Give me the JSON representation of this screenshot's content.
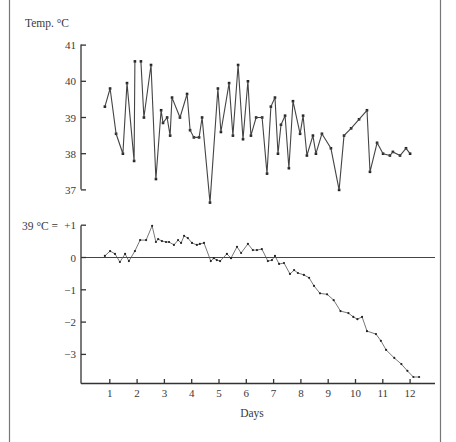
{
  "chart_data": [
    {
      "type": "line",
      "title": "",
      "ylabel": "Temp. °C",
      "xlabel": "",
      "ylim": [
        37,
        41
      ],
      "yticks": [
        37,
        38,
        39,
        40,
        41
      ],
      "grid": false,
      "markers": true,
      "series": [
        {
          "name": "Body temperature",
          "x": [
            0.82,
            1.01,
            1.23,
            1.48,
            1.63,
            1.89,
            1.92,
            2.14,
            2.25,
            2.51,
            2.69,
            2.88,
            2.95,
            3.1,
            3.21,
            3.28,
            3.57,
            3.83,
            3.94,
            4.08,
            4.27,
            4.38,
            4.67,
            4.96,
            5.07,
            5.37,
            5.51,
            5.7,
            5.88,
            6.06,
            6.17,
            6.36,
            6.58,
            6.76,
            6.9,
            7.05,
            7.16,
            7.27,
            7.42,
            7.56,
            7.71,
            7.97,
            8.08,
            8.22,
            8.44,
            8.55,
            8.77,
            9.1,
            9.4,
            9.58,
            9.84,
            10.13,
            10.42,
            10.53,
            10.79,
            11.01,
            11.26,
            11.37,
            11.63,
            11.85,
            12.0
          ],
          "values": [
            39.3,
            39.8,
            38.55,
            38.0,
            39.95,
            37.8,
            40.55,
            40.55,
            39.0,
            40.45,
            37.3,
            39.2,
            38.85,
            39.0,
            38.5,
            39.55,
            39.0,
            39.65,
            38.65,
            38.45,
            38.45,
            39.0,
            36.65,
            39.8,
            38.6,
            39.95,
            38.5,
            40.45,
            38.4,
            40.0,
            38.5,
            39.0,
            39.0,
            37.45,
            39.3,
            39.55,
            38.0,
            38.8,
            39.05,
            37.6,
            39.45,
            38.55,
            39.05,
            37.95,
            38.5,
            38.0,
            38.55,
            38.15,
            37.0,
            38.5,
            38.7,
            38.95,
            39.2,
            37.5,
            38.3,
            38.0,
            37.95,
            38.05,
            37.95,
            38.15,
            38.0
          ],
          "breaks_after_index": [
            6
          ]
        }
      ]
    },
    {
      "type": "line",
      "title": "",
      "ylabel": "39 °C =",
      "xlabel": "Days",
      "ylim": [
        -3.8,
        1
      ],
      "yticks": [
        1,
        0,
        -1,
        -2,
        -3
      ],
      "ytick_labels": [
        "+1",
        "0",
        "−1",
        "−2",
        "−3"
      ],
      "xlim": [
        0,
        12.9
      ],
      "xticks": [
        1,
        2,
        3,
        4,
        5,
        6,
        7,
        8,
        9,
        10,
        11,
        12
      ],
      "xtick_labels": [
        "1",
        "2",
        "3",
        "4",
        "5",
        "6",
        "7",
        "8",
        "9",
        "10",
        "11",
        "12"
      ],
      "reference_line": 0,
      "grid": false,
      "markers": true,
      "series": [
        {
          "name": "Cumulative deviation from 39 °C",
          "x": [
            0.82,
            1.01,
            1.19,
            1.37,
            1.56,
            1.7,
            1.92,
            2.11,
            2.33,
            2.55,
            2.69,
            2.77,
            2.91,
            3.06,
            3.17,
            3.35,
            3.5,
            3.61,
            3.72,
            3.86,
            4.01,
            4.19,
            4.3,
            4.45,
            4.7,
            4.81,
            4.92,
            5.04,
            5.29,
            5.44,
            5.66,
            5.81,
            6.06,
            6.24,
            6.39,
            6.57,
            6.79,
            6.94,
            7.05,
            7.2,
            7.38,
            7.6,
            7.75,
            7.89,
            8.11,
            8.3,
            8.48,
            8.7,
            8.96,
            9.2,
            9.45,
            9.74,
            9.92,
            10.07,
            10.24,
            10.42,
            10.75,
            10.93,
            11.12,
            11.42,
            11.68,
            11.9,
            12.12,
            12.33
          ],
          "values": [
            0.05,
            0.2,
            0.11,
            -0.14,
            0.11,
            -0.11,
            0.2,
            0.54,
            0.54,
            0.98,
            0.48,
            0.57,
            0.51,
            0.48,
            0.48,
            0.39,
            0.54,
            0.45,
            0.67,
            0.6,
            0.45,
            0.39,
            0.42,
            0.45,
            -0.11,
            -0.02,
            -0.08,
            -0.11,
            0.11,
            -0.02,
            0.33,
            0.14,
            0.42,
            0.23,
            0.23,
            0.26,
            -0.11,
            -0.08,
            0.05,
            -0.2,
            -0.17,
            -0.51,
            -0.39,
            -0.48,
            -0.54,
            -0.63,
            -0.88,
            -1.11,
            -1.14,
            -1.32,
            -1.66,
            -1.72,
            -1.84,
            -1.91,
            -1.84,
            -2.28,
            -2.37,
            -2.58,
            -2.86,
            -3.11,
            -3.3,
            -3.51,
            -3.7,
            -3.7
          ]
        }
      ]
    }
  ],
  "labels": {
    "top_ylabel": "Temp. °C",
    "bottom_ylabel": "39 °C =",
    "xlabel": "Days"
  }
}
